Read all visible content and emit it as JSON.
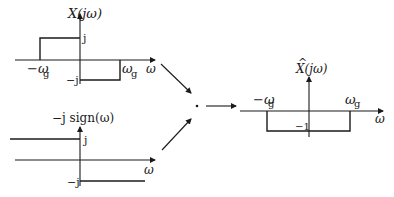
{
  "diagram": {
    "graphs": [
      {
        "id": "input-spectrum",
        "title": "X(jω)",
        "x_axis_label": "ω",
        "tick_left": "−ω",
        "tick_left_sub": "g",
        "tick_right": "ω",
        "tick_right_sub": "g",
        "level_pos": "j",
        "level_neg": "−j"
      },
      {
        "id": "hilbert-response",
        "title": "−j sign(ω)",
        "x_axis_label": "ω",
        "level_pos": "j",
        "level_neg": "−j"
      },
      {
        "id": "output-spectrum",
        "title_hat": "^",
        "title": "X(jω)",
        "x_axis_label": "ω",
        "tick_left": "−ω",
        "tick_left_sub": "g",
        "tick_right": "ω",
        "tick_right_sub": "g",
        "level_neg": "−1"
      }
    ],
    "operator": "·",
    "colors": {
      "ink": "#1a1a1a",
      "background": "#ffffff"
    }
  }
}
